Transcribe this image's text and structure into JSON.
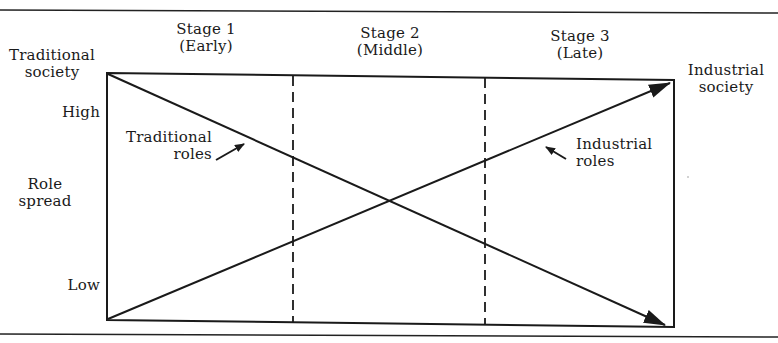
{
  "diagram": {
    "stages": [
      {
        "label": "Stage 1",
        "sub": "(Early)"
      },
      {
        "label": "Stage 2",
        "sub": "(Middle)"
      },
      {
        "label": "Stage 3",
        "sub": "(Late)"
      }
    ],
    "left_endpoint": {
      "line1": "Traditional",
      "line2": "society"
    },
    "right_endpoint": {
      "line1": "Industrial",
      "line2": "society"
    },
    "y_axis": {
      "title_line1": "Role",
      "title_line2": "spread",
      "high": "High",
      "low": "Low"
    },
    "lines": [
      {
        "name": "Traditional roles",
        "label_line1": "Traditional",
        "label_line2": "roles",
        "from": "High",
        "to": "Low",
        "direction": "decreasing"
      },
      {
        "name": "Industrial roles",
        "label_line1": "Industrial",
        "label_line2": "roles",
        "from": "Low",
        "to": "High",
        "direction": "increasing"
      }
    ],
    "line_color": "#1a1a1a"
  }
}
